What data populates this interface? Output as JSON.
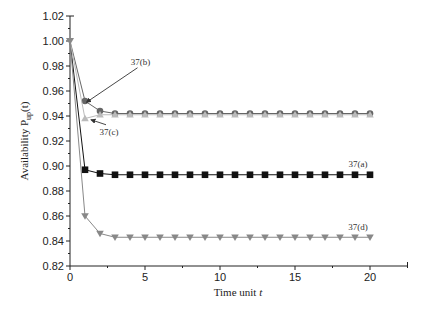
{
  "chart_data": {
    "type": "line",
    "title": "",
    "xlabel": "Time unit t",
    "ylabel": "Availability P_up(t)",
    "xlim": [
      0,
      22.5
    ],
    "ylim": [
      0.82,
      1.02
    ],
    "grid": false,
    "legend": "none (inline annotations)",
    "x_ticks": [
      "0",
      "5",
      "10",
      "15",
      "20"
    ],
    "y_ticks": [
      "0.82",
      "0.84",
      "0.86",
      "0.88",
      "0.90",
      "0.92",
      "0.94",
      "0.96",
      "0.98",
      "1.00",
      "1.02"
    ],
    "x": [
      0,
      1,
      2,
      3,
      4,
      5,
      6,
      7,
      8,
      9,
      10,
      11,
      12,
      13,
      14,
      15,
      16,
      17,
      18,
      19,
      20
    ],
    "series": [
      {
        "name": "37(a)",
        "marker": "square",
        "color": "#111111",
        "values": [
          1.0,
          0.897,
          0.894,
          0.893,
          0.893,
          0.893,
          0.893,
          0.893,
          0.893,
          0.893,
          0.893,
          0.893,
          0.893,
          0.893,
          0.893,
          0.893,
          0.893,
          0.893,
          0.893,
          0.893,
          0.893
        ]
      },
      {
        "name": "37(b)",
        "marker": "circle",
        "color": "#666666",
        "values": [
          1.0,
          0.952,
          0.944,
          0.942,
          0.942,
          0.942,
          0.942,
          0.942,
          0.942,
          0.942,
          0.942,
          0.942,
          0.942,
          0.942,
          0.942,
          0.942,
          0.942,
          0.942,
          0.942,
          0.942,
          0.942
        ]
      },
      {
        "name": "37(c)",
        "marker": "triangle-up",
        "color": "#bbbbbb",
        "values": [
          1.0,
          0.938,
          0.941,
          0.941,
          0.941,
          0.941,
          0.941,
          0.941,
          0.941,
          0.941,
          0.941,
          0.941,
          0.941,
          0.941,
          0.941,
          0.941,
          0.941,
          0.941,
          0.941,
          0.941,
          0.941
        ]
      },
      {
        "name": "37(d)",
        "marker": "triangle-down",
        "color": "#888888",
        "values": [
          1.0,
          0.86,
          0.846,
          0.843,
          0.843,
          0.843,
          0.843,
          0.843,
          0.843,
          0.843,
          0.843,
          0.843,
          0.843,
          0.843,
          0.843,
          0.843,
          0.843,
          0.843,
          0.843,
          0.843,
          0.843
        ]
      }
    ],
    "annotations": [
      {
        "text": "37(a)",
        "x": 19.2,
        "y": 0.899
      },
      {
        "text": "37(b)",
        "x": 4.7,
        "y": 0.981,
        "arrow_to": [
          1.1,
          0.951
        ]
      },
      {
        "text": "37(c)",
        "x": 2.6,
        "y": 0.925,
        "arrow_to": [
          1.4,
          0.937
        ]
      },
      {
        "text": "37(d)",
        "x": 19.2,
        "y": 0.849
      }
    ]
  },
  "labels": {
    "xlabel_main": "Time unit ",
    "xlabel_var": "t",
    "ylabel_main": "Availability P",
    "ylabel_sub": "up",
    "ylabel_tail": "(t)"
  }
}
